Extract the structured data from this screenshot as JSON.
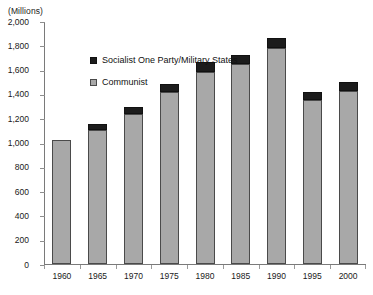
{
  "units_label": "(Millions)",
  "legend": {
    "position": "inside-top-left",
    "items": [
      {
        "label": "Socialist One Party/Military States",
        "color": "#1c1c1c",
        "swatch": "swatch-dark"
      },
      {
        "label": "Communist",
        "color": "#a8a8a8",
        "swatch": "swatch-gray"
      }
    ]
  },
  "axis": {
    "y_tick_labels": [
      "2,000",
      "1,800",
      "1,600",
      "1,400",
      "1,200",
      "1,000",
      "800",
      "600",
      "400",
      "200",
      "0"
    ],
    "x_tick_labels": [
      "1960",
      "1965",
      "1970",
      "1975",
      "1980",
      "1985",
      "1990",
      "1995",
      "2000"
    ]
  },
  "colors": {
    "communist": "#a8a8a8",
    "socialist_one_party": "#1c1c1c",
    "axis": "#7a7a7a",
    "background": "#ffffff",
    "text": "#1a1a1a"
  },
  "chart_data": {
    "type": "bar",
    "subtype": "stacked-column",
    "title": "",
    "subtitle": "",
    "xlabel": "",
    "ylabel": "(Millions)",
    "units": "Millions",
    "ylim": [
      0,
      2000
    ],
    "ytick_step": 200,
    "yticks": [
      0,
      200,
      400,
      600,
      800,
      1000,
      1200,
      1400,
      1600,
      1800,
      2000
    ],
    "grid": false,
    "legend_position": "inside-top-left",
    "categories": [
      "1960",
      "1965",
      "1970",
      "1975",
      "1980",
      "1985",
      "1990",
      "1995",
      "2000"
    ],
    "series": [
      {
        "name": "Communist",
        "color": "#a8a8a8",
        "values": [
          1020,
          1105,
          1235,
          1415,
          1580,
          1650,
          1780,
          1350,
          1425
        ]
      },
      {
        "name": "Socialist One Party/Military States",
        "color": "#1c1c1c",
        "values": [
          0,
          50,
          55,
          65,
          85,
          70,
          80,
          65,
          70
        ]
      }
    ],
    "totals": [
      1020,
      1155,
      1290,
      1480,
      1665,
      1720,
      1860,
      1415,
      1495
    ]
  }
}
